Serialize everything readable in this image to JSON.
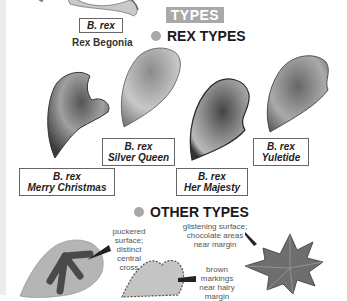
{
  "header": {
    "badge": "TYPES",
    "top_specimen": {
      "species": "B. rex",
      "common_name": "Rex Begonia"
    }
  },
  "rex_types": {
    "heading": "REX TYPES",
    "items": [
      {
        "species": "B. rex",
        "cultivar": "Merry Christmas"
      },
      {
        "species": "B. rex",
        "cultivar": "Silver Queen"
      },
      {
        "species": "B. rex",
        "cultivar": "Her Majesty"
      },
      {
        "species": "B. rex",
        "cultivar": "Yuletide"
      }
    ]
  },
  "other_types": {
    "heading": "OTHER TYPES",
    "notes": [
      {
        "line1": "puckered",
        "line2": "surface;",
        "line3": "distinct",
        "line4": "central",
        "line5": "cross"
      },
      {
        "line1": "brown",
        "line2": "markings",
        "line3": "near hairy",
        "line4": "margin"
      },
      {
        "line1": "glistening surface;",
        "line2": "chocolate areas",
        "line3": "near margin"
      }
    ]
  },
  "colors": {
    "badge_bg": "#a9a9a9",
    "bullet": "#a8a8a8",
    "text": "#1a1a1a"
  }
}
